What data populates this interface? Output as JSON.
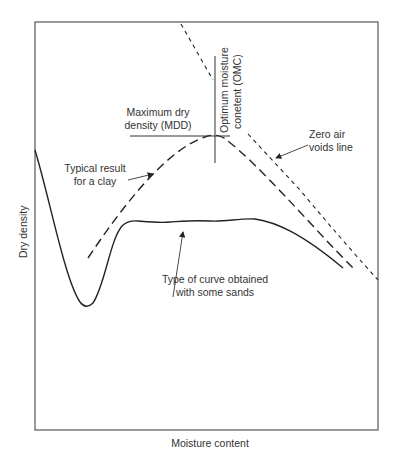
{
  "figure": {
    "xlabel": "Moisture content",
    "ylabel": "Dry density",
    "annotations": {
      "mdd_line1": "Maximum dry",
      "mdd_line2": "density (MDD)",
      "omc_line1": "Optimum moisture",
      "omc_line2": "conetent (OMC)",
      "zav_line1": "Zero air",
      "zav_line2": "voids line",
      "clay_line1": "Typical result",
      "clay_line2": "for a clay",
      "sand_line1": "Type of curve obtained",
      "sand_line2": "with some sands"
    },
    "curves": [
      {
        "name": "Typical result for a clay",
        "style": "long-dash"
      },
      {
        "name": "Zero air voids line",
        "style": "short-dash"
      },
      {
        "name": "Type of curve obtained with some sands",
        "style": "solid"
      }
    ],
    "colors": {
      "line": "#222222",
      "frame": "#555555",
      "text": "#333333"
    }
  }
}
